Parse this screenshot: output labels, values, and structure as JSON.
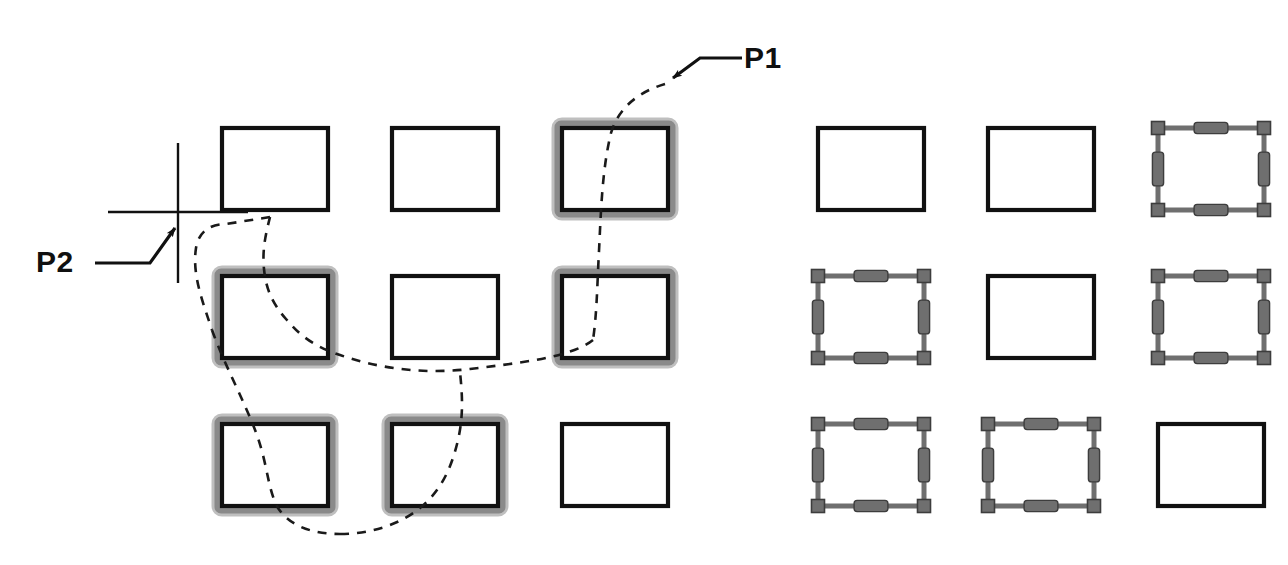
{
  "figure": {
    "kind": "cad-lasso-selection-diagram",
    "background_color": "#ffffff",
    "stroke_color": "#111111",
    "highlight_color": "#8a8a8a",
    "grip_color": "#6f6f6f",
    "lasso_style": "dashed",
    "width": 1288,
    "height": 565
  },
  "annotations": {
    "p1": {
      "label": "P1",
      "label_x": 744,
      "label_y": 68,
      "leader": "M 742 58 L 700 58 L 673 78",
      "arrow_tip_x": 665,
      "arrow_tip_y": 84,
      "description": "lasso-start-point"
    },
    "p2": {
      "label": "P2",
      "label_x": 36,
      "label_y": 272,
      "leader": "M 95 263 L 150 263 L 175 228",
      "arrow_tip_x": 181,
      "arrow_tip_y": 219,
      "description": "lasso-end-point-crosshair"
    }
  },
  "crosshair": {
    "center_x": 178,
    "center_y": 212,
    "h_x1": 108,
    "h_x2": 248,
    "v_y1": 143,
    "v_y2": 283
  },
  "lasso_path": "M 665 84 C 640 90 618 104 610 132 C 600 170 600 210 598 250 C 596 286 596 310 592 338 C 572 356 520 362 470 368 C 420 374 374 366 340 354 C 310 344 298 332 286 318 C 272 302 266 288 264 268 C 262 248 266 232 270 216 L 272 224 M 272 224 L 226 224 C 208 224 198 234 196 248 C 192 274 202 300 212 330 C 224 364 246 404 258 438 C 268 468 268 490 278 508 C 290 526 312 534 340 534 C 372 534 400 524 420 508 C 442 490 452 466 458 440 C 464 414 462 392 460 372",
  "lasso_segments": [
    "M 665 84 C 641 91 619 106 611 133 C 602 170 601 211 599 251 C 597 288 597 312 593 340",
    "M 593 340 C 572 357 520 363 470 369 C 420 375 374 367 340 355 C 310 345 298 333 286 319 C 272 303 266 289 264 269 C 262 249 266 233 270 217",
    "M 270 217 L 226 224 C 208 224 198 234 196 248 C 192 274 202 300 212 330",
    "M 212 330 C 224 364 246 404 258 438 C 268 468 268 490 278 508 C 290 526 312 534 340 534",
    "M 340 534 C 372 534 400 524 420 508 C 442 490 452 466 458 440 C 464 414 462 392 460 372"
  ],
  "left_group": {
    "title_semantic": "objects-crossed-by-lasso",
    "origin_x": 222,
    "origin_y": 128,
    "col_step": 170,
    "row_step": 148,
    "rect_width": 106,
    "rect_height": 82,
    "rows": [
      {
        "row": 1,
        "cells": [
          {
            "col": 1,
            "state": "normal"
          },
          {
            "col": 2,
            "state": "normal"
          },
          {
            "col": 3,
            "state": "highlighted"
          }
        ]
      },
      {
        "row": 2,
        "cells": [
          {
            "col": 1,
            "state": "highlighted"
          },
          {
            "col": 2,
            "state": "normal"
          },
          {
            "col": 3,
            "state": "highlighted"
          }
        ]
      },
      {
        "row": 3,
        "cells": [
          {
            "col": 1,
            "state": "highlighted"
          },
          {
            "col": 2,
            "state": "highlighted"
          },
          {
            "col": 3,
            "state": "normal"
          }
        ]
      }
    ]
  },
  "right_group": {
    "title_semantic": "objects-with-grips-shown",
    "origin_x": 818,
    "origin_y": 128,
    "col_step": 170,
    "row_step": 148,
    "rect_width": 106,
    "rect_height": 82,
    "grip_size": 13,
    "rows": [
      {
        "row": 1,
        "cells": [
          {
            "col": 1,
            "state": "normal"
          },
          {
            "col": 2,
            "state": "normal"
          },
          {
            "col": 3,
            "state": "gripped"
          }
        ]
      },
      {
        "row": 2,
        "cells": [
          {
            "col": 1,
            "state": "gripped"
          },
          {
            "col": 2,
            "state": "normal"
          },
          {
            "col": 3,
            "state": "gripped"
          }
        ]
      },
      {
        "row": 3,
        "cells": [
          {
            "col": 1,
            "state": "gripped"
          },
          {
            "col": 2,
            "state": "gripped"
          },
          {
            "col": 3,
            "state": "normal"
          }
        ]
      }
    ]
  }
}
